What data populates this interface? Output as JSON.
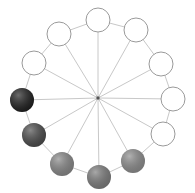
{
  "spinner": {
    "center": [
      98,
      98
    ],
    "ring_color": "#c8c8c8",
    "spoke_color": "#c8c8c8",
    "hub_color": "#555555",
    "dots": [
      {
        "x": 98,
        "y": 20,
        "fill": "#ffffff"
      },
      {
        "x": 136,
        "y": 30,
        "fill": "#ffffff"
      },
      {
        "x": 161,
        "y": 64,
        "fill": "#ffffff"
      },
      {
        "x": 173,
        "y": 99,
        "fill": "#ffffff"
      },
      {
        "x": 163,
        "y": 134,
        "fill": "#ffffff"
      },
      {
        "x": 133,
        "y": 161,
        "fill": "#8a8a8a"
      },
      {
        "x": 99,
        "y": 177,
        "fill": "#7a7a7a"
      },
      {
        "x": 62,
        "y": 164,
        "fill": "#858585"
      },
      {
        "x": 34,
        "y": 135,
        "fill": "#4a4a4a"
      },
      {
        "x": 22,
        "y": 100,
        "fill": "#1e1e1e"
      },
      {
        "x": 34,
        "y": 63,
        "fill": "#ffffff"
      },
      {
        "x": 59,
        "y": 34,
        "fill": "#ffffff"
      }
    ]
  }
}
